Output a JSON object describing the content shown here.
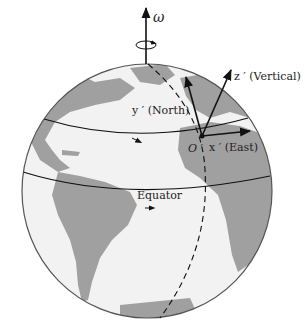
{
  "diagram": {
    "type": "rotating-earth-local-frame",
    "colors": {
      "ocean": "#f2f2f2",
      "land": "#9e9e9e",
      "outline": "#555555",
      "ink": "#111111"
    },
    "labels": {
      "omega": "ω",
      "z_axis": "z ′ (Vertical)",
      "y_axis": "y ′ (North)",
      "x_axis": "x ′ (East)",
      "origin": "O ′",
      "equator": "Equator"
    }
  }
}
